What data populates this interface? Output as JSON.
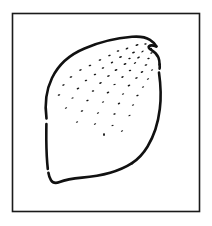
{
  "figure": {
    "subject_name": "potato",
    "style": "black-and-white stippled line art",
    "canvas": {
      "width": 212,
      "height": 226,
      "background_color": "#ffffff"
    }
  },
  "frame": {
    "name": "border-frame",
    "shape": "rectangle",
    "x": 12.5,
    "y": 13.5,
    "width": 187,
    "height": 198,
    "stroke_color": "#1a1a1a",
    "stroke_width": 1.6,
    "fill": "none"
  },
  "subject": {
    "name": "potato-outline",
    "stroke_color": "#111111",
    "stroke_width": 2.6,
    "fill_color": "#ffffff",
    "bounds": {
      "x": 42,
      "y": 36,
      "width": 126,
      "height": 148
    },
    "segments": [
      {
        "id": "main-contour",
        "description": "upper-left sweep over the crown to the right shoulder notch",
        "path": "M 46.5 118.5 C 44.5 104 46.0 90.5 52.0 78.0 C 58.5 64.5 70.0 54.5 84.5 48.5 C 99.5 42.0 117.0 38.0 132.0 36.8 C 139.5 36.2 145.8 37.2 150.0 39.8 C 153.2 41.8 155.2 44.2 156.4 46.4"
      },
      {
        "id": "shoulder-notch",
        "description": "small cleft / eye notch at the top-right shoulder",
        "path": "M 156.4 46.4 C 153.0 45.2 150.4 45.0 149.0 46.2 C 148.0 47.2 149.0 48.6 151.6 50.2 C 154.6 52.0 157.0 54.4 158.4 57.6 C 159.2 59.6 159.6 62.0 159.6 64.6"
      },
      {
        "id": "right-flank-upper",
        "description": "short right flank above the line break",
        "path": "M 159.6 64.6 C 159.8 66.0 159.8 67.2 159.6 68.6"
      },
      {
        "id": "right-flank-lower",
        "description": "right flank descending to the rounded bottom-right",
        "path": "M 159.0 72.6 C 160.6 84.0 161.4 96.5 159.8 109.0 C 158.2 122.5 154.2 135.5 147.6 146.5 C 143.4 153.5 138.2 159.0 132.0 163.2"
      },
      {
        "id": "bottom-edge",
        "description": "flat lower edge running right-to-left with a hook at the left end",
        "path": "M 132.0 163.2 C 118.0 172.2 100.0 176.2 82.0 177.6 C 73.0 178.4 65.0 179.8 59.6 182.0 C 55.6 183.6 52.8 183.0 51.0 180.2 C 49.6 178.0 48.8 175.4 48.4 172.8"
      },
      {
        "id": "left-flank-lower",
        "description": "left flank between the bottom hook and the line break",
        "path": "M 47.8 169.0 C 46.8 160.0 46.4 150.0 46.3 140.0 C 46.3 133.0 46.3 128.0 46.4 124.0"
      }
    ],
    "line_breaks": [
      {
        "id": "left-flank-break",
        "x": 46.4,
        "y": 121.0,
        "length": 4
      },
      {
        "id": "right-flank-break",
        "x": 159.4,
        "y": 70.6,
        "length": 4
      }
    ]
  },
  "stipple": {
    "name": "stipple-texture",
    "description": "dense short dashes/specks across the upper body, thinning toward the bottom",
    "color": "#141414",
    "count": 58,
    "dots": [
      {
        "x": 137.0,
        "y": 45.0,
        "w": 3.2,
        "h": 1.5,
        "r": -18
      },
      {
        "x": 145.5,
        "y": 44.0,
        "w": 2.6,
        "h": 1.4,
        "r": -12
      },
      {
        "x": 151.0,
        "y": 48.6,
        "w": 2.4,
        "h": 1.3,
        "r": -20
      },
      {
        "x": 127.0,
        "y": 48.5,
        "w": 3.0,
        "h": 1.5,
        "r": -25
      },
      {
        "x": 118.0,
        "y": 51.0,
        "w": 2.8,
        "h": 1.4,
        "r": -15
      },
      {
        "x": 133.5,
        "y": 52.5,
        "w": 3.0,
        "h": 1.5,
        "r": -20
      },
      {
        "x": 142.5,
        "y": 51.5,
        "w": 2.6,
        "h": 1.4,
        "r": -30
      },
      {
        "x": 151.5,
        "y": 53.0,
        "w": 2.5,
        "h": 1.4,
        "r": -18
      },
      {
        "x": 109.5,
        "y": 55.5,
        "w": 2.8,
        "h": 1.4,
        "r": -18
      },
      {
        "x": 120.5,
        "y": 57.0,
        "w": 3.0,
        "h": 1.5,
        "r": -22
      },
      {
        "x": 129.5,
        "y": 58.5,
        "w": 2.6,
        "h": 1.4,
        "r": -16
      },
      {
        "x": 138.5,
        "y": 57.5,
        "w": 3.0,
        "h": 1.4,
        "r": -26
      },
      {
        "x": 148.5,
        "y": 58.5,
        "w": 2.6,
        "h": 1.4,
        "r": -14
      },
      {
        "x": 100.0,
        "y": 60.0,
        "w": 2.8,
        "h": 1.4,
        "r": -20
      },
      {
        "x": 112.0,
        "y": 62.5,
        "w": 2.6,
        "h": 1.4,
        "r": -24
      },
      {
        "x": 125.0,
        "y": 64.0,
        "w": 3.0,
        "h": 1.5,
        "r": -18
      },
      {
        "x": 135.0,
        "y": 63.0,
        "w": 2.6,
        "h": 1.3,
        "r": -28
      },
      {
        "x": 146.0,
        "y": 65.0,
        "w": 2.8,
        "h": 1.4,
        "r": -16
      },
      {
        "x": 90.0,
        "y": 65.5,
        "w": 2.8,
        "h": 1.4,
        "r": -20
      },
      {
        "x": 103.0,
        "y": 68.0,
        "w": 2.6,
        "h": 1.4,
        "r": -18
      },
      {
        "x": 116.0,
        "y": 70.0,
        "w": 3.0,
        "h": 1.5,
        "r": -22
      },
      {
        "x": 130.0,
        "y": 70.5,
        "w": 2.6,
        "h": 1.4,
        "r": -15
      },
      {
        "x": 142.0,
        "y": 72.0,
        "w": 2.8,
        "h": 1.4,
        "r": -24
      },
      {
        "x": 152.0,
        "y": 70.0,
        "w": 2.4,
        "h": 1.3,
        "r": -18
      },
      {
        "x": 80.5,
        "y": 70.0,
        "w": 2.8,
        "h": 1.4,
        "r": -18
      },
      {
        "x": 95.0,
        "y": 74.5,
        "w": 2.6,
        "h": 1.4,
        "r": -22
      },
      {
        "x": 108.5,
        "y": 76.0,
        "w": 3.0,
        "h": 1.4,
        "r": -16
      },
      {
        "x": 122.5,
        "y": 77.0,
        "w": 2.6,
        "h": 1.4,
        "r": -26
      },
      {
        "x": 136.5,
        "y": 78.0,
        "w": 2.8,
        "h": 1.4,
        "r": -18
      },
      {
        "x": 148.0,
        "y": 79.0,
        "w": 2.4,
        "h": 1.3,
        "r": -20
      },
      {
        "x": 71.0,
        "y": 77.0,
        "w": 2.8,
        "h": 1.4,
        "r": -20
      },
      {
        "x": 86.0,
        "y": 80.5,
        "w": 2.6,
        "h": 1.4,
        "r": -18
      },
      {
        "x": 100.5,
        "y": 83.0,
        "w": 2.8,
        "h": 1.4,
        "r": -24
      },
      {
        "x": 114.5,
        "y": 84.5,
        "w": 2.6,
        "h": 1.3,
        "r": -16
      },
      {
        "x": 129.0,
        "y": 85.5,
        "w": 2.8,
        "h": 1.4,
        "r": -22
      },
      {
        "x": 143.0,
        "y": 87.0,
        "w": 2.4,
        "h": 1.3,
        "r": -18
      },
      {
        "x": 63.5,
        "y": 85.0,
        "w": 2.6,
        "h": 1.4,
        "r": -18
      },
      {
        "x": 78.0,
        "y": 88.5,
        "w": 2.8,
        "h": 1.4,
        "r": -22
      },
      {
        "x": 93.0,
        "y": 91.0,
        "w": 2.6,
        "h": 1.4,
        "r": -16
      },
      {
        "x": 108.0,
        "y": 92.5,
        "w": 2.8,
        "h": 1.4,
        "r": -24
      },
      {
        "x": 123.0,
        "y": 94.0,
        "w": 2.4,
        "h": 1.3,
        "r": -18
      },
      {
        "x": 137.5,
        "y": 95.5,
        "w": 2.6,
        "h": 1.4,
        "r": -20
      },
      {
        "x": 59.0,
        "y": 95.0,
        "w": 2.6,
        "h": 1.4,
        "r": -20
      },
      {
        "x": 72.5,
        "y": 98.0,
        "w": 2.4,
        "h": 1.3,
        "r": -18
      },
      {
        "x": 87.5,
        "y": 100.5,
        "w": 2.6,
        "h": 1.4,
        "r": -22
      },
      {
        "x": 103.0,
        "y": 102.0,
        "w": 2.4,
        "h": 1.3,
        "r": -16
      },
      {
        "x": 119.0,
        "y": 103.5,
        "w": 2.6,
        "h": 1.4,
        "r": -24
      },
      {
        "x": 133.0,
        "y": 105.0,
        "w": 2.4,
        "h": 1.3,
        "r": -18
      },
      {
        "x": 66.0,
        "y": 108.0,
        "w": 2.4,
        "h": 1.3,
        "r": -20
      },
      {
        "x": 82.0,
        "y": 111.0,
        "w": 2.6,
        "h": 1.4,
        "r": -18
      },
      {
        "x": 98.0,
        "y": 113.0,
        "w": 2.4,
        "h": 1.3,
        "r": -22
      },
      {
        "x": 114.5,
        "y": 114.0,
        "w": 2.6,
        "h": 1.4,
        "r": -16
      },
      {
        "x": 129.5,
        "y": 115.5,
        "w": 2.4,
        "h": 1.3,
        "r": -20
      },
      {
        "x": 77.0,
        "y": 122.0,
        "w": 2.4,
        "h": 1.3,
        "r": -18
      },
      {
        "x": 95.0,
        "y": 124.0,
        "w": 2.4,
        "h": 1.3,
        "r": -22
      },
      {
        "x": 112.5,
        "y": 125.5,
        "w": 2.4,
        "h": 1.3,
        "r": -16
      },
      {
        "x": 104.0,
        "y": 134.5,
        "w": 1.8,
        "h": 3.0,
        "r": 0
      },
      {
        "x": 122.0,
        "y": 131.0,
        "w": 2.4,
        "h": 1.3,
        "r": -24
      }
    ]
  }
}
